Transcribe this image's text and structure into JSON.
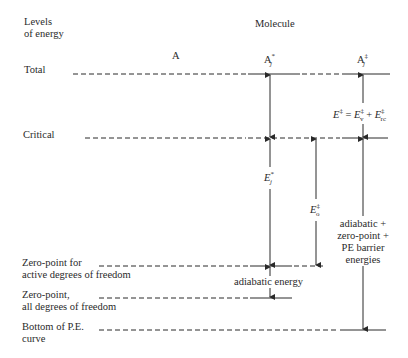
{
  "header": {
    "levels_label_line1": "Levels",
    "levels_label_line2": "of energy",
    "molecule_label": "Molecule"
  },
  "columns": {
    "a": "A",
    "a_star": {
      "base": "A",
      "sup": "*",
      "sub": "j"
    },
    "a_ddag": {
      "base": "A",
      "sup": "‡",
      "sub": "j"
    }
  },
  "levels": [
    {
      "id": "total",
      "line1": "Total",
      "line2": ""
    },
    {
      "id": "critical",
      "line1": "Critical",
      "line2": ""
    },
    {
      "id": "zero-point-active",
      "line1": "Zero-point for",
      "line2": "active degrees of freedom"
    },
    {
      "id": "zero-point-all",
      "line1": "Zero-point,",
      "line2": "all degrees of freedom"
    },
    {
      "id": "bottom",
      "line1": "Bottom of P.E.",
      "line2": "curve"
    }
  ],
  "annotations": {
    "e_ddag_eq": {
      "lhs": "E",
      "lhs_sup": "‡",
      "eq": " = ",
      "t1": "E",
      "t1_sup": "‡",
      "t1_sub": "v",
      "plus": " + ",
      "t2": "E",
      "t2_sup": "‡",
      "t2_sub": "rc"
    },
    "e_star_j": {
      "base": "E",
      "sup": "*",
      "sub": "j"
    },
    "e_ddag_0": {
      "base": "E",
      "sup": "‡",
      "sub": "o"
    },
    "adiabatic_energy": "adiabatic energy",
    "barrier_line1": "adiabatic +",
    "barrier_line2": "zero-point +",
    "barrier_line3": "PE barrier",
    "barrier_line4": "energies"
  }
}
